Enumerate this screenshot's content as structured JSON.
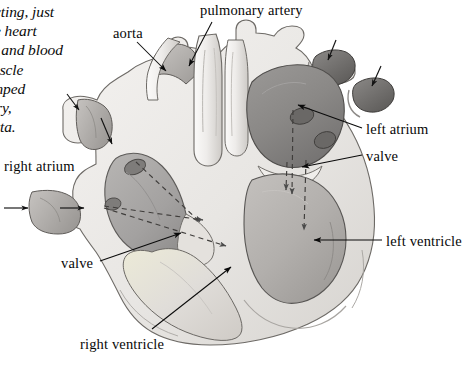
{
  "figure": {
    "type": "anatomical-diagram",
    "background_color": "#ffffff",
    "ink_color": "#080808"
  },
  "caption": {
    "note": "italic serif body text clipped by the left edge of the screenshot",
    "lines": [
      "cting, just",
      "e heart",
      "ns and blood",
      "uscle",
      "mped",
      "ry,",
      "rta."
    ]
  },
  "labels": [
    {
      "id": "pulmonary-artery",
      "text": "pulmonary artery",
      "x": 200,
      "y": 4,
      "anchor": "start"
    },
    {
      "id": "aorta",
      "text": "aorta",
      "x": 113,
      "y": 26,
      "anchor": "start"
    },
    {
      "id": "right-atrium",
      "text": "right atrium",
      "x": 4,
      "y": 159,
      "anchor": "start"
    },
    {
      "id": "left-atrium",
      "text": "left atrium",
      "x": 365,
      "y": 122,
      "anchor": "start"
    },
    {
      "id": "valve-right",
      "text": "valve",
      "x": 365,
      "y": 149,
      "anchor": "start"
    },
    {
      "id": "left-ventricle",
      "text": "left ventricle",
      "x": 385,
      "y": 234,
      "anchor": "start"
    },
    {
      "id": "valve-left",
      "text": "valve",
      "x": 61,
      "y": 256,
      "anchor": "start"
    },
    {
      "id": "right-ventricle",
      "text": "right ventricle",
      "x": 80,
      "y": 337,
      "anchor": "start"
    }
  ],
  "leader_lines": [
    {
      "id": "leader-pulmonary-artery",
      "from": [
        212,
        22
      ],
      "to": [
        188,
        68
      ],
      "arrow": true
    },
    {
      "id": "leader-aorta",
      "from": [
        137,
        42
      ],
      "to": [
        167,
        72
      ],
      "arrow": true
    },
    {
      "id": "leader-left-atrium",
      "from": [
        362,
        128
      ],
      "to": [
        296,
        104
      ],
      "arrow": true
    },
    {
      "id": "leader-valve-right",
      "from": [
        362,
        155
      ],
      "to": [
        300,
        167
      ],
      "arrow": true
    },
    {
      "id": "leader-left-ventricle",
      "from": [
        382,
        240
      ],
      "to": [
        312,
        240
      ],
      "arrow": true
    },
    {
      "id": "leader-valve-left",
      "from": [
        100,
        261
      ],
      "to": [
        182,
        234
      ],
      "arrow": true
    },
    {
      "id": "leader-right-ventricle",
      "from": [
        152,
        329
      ],
      "to": [
        232,
        268
      ],
      "arrow": true
    }
  ],
  "flow_arrows": [
    {
      "id": "flow-superior-vena-cava-in",
      "style": "solid",
      "from": [
        69,
        98
      ],
      "to": [
        80,
        112
      ]
    },
    {
      "id": "flow-superior-vena-cava-down",
      "style": "solid",
      "from": [
        103,
        120
      ],
      "to": [
        112,
        146
      ]
    },
    {
      "id": "flow-inferior-vena-cava-in",
      "style": "solid",
      "from": [
        6,
        208
      ],
      "to": [
        30,
        208
      ]
    },
    {
      "id": "flow-inferior-vena-cava-right",
      "style": "solid",
      "from": [
        62,
        208
      ],
      "to": [
        86,
        208
      ]
    },
    {
      "id": "flow-pulmonary-vein-1",
      "style": "solid",
      "from": [
        333,
        44
      ],
      "to": [
        326,
        62
      ]
    },
    {
      "id": "flow-pulmonary-vein-2",
      "style": "solid",
      "from": [
        378,
        70
      ],
      "to": [
        370,
        88
      ]
    },
    {
      "id": "flow-right-atrium-1",
      "style": "dashed",
      "from": [
        136,
        162
      ],
      "to": [
        200,
        222
      ]
    },
    {
      "id": "flow-right-atrium-2",
      "style": "dashed",
      "from": [
        104,
        206
      ],
      "to": [
        203,
        220
      ]
    },
    {
      "id": "flow-right-atrium-3",
      "style": "dashed",
      "from": [
        104,
        208
      ],
      "to": [
        228,
        248
      ]
    },
    {
      "id": "flow-left-atrium-down",
      "style": "dashed",
      "from": [
        293,
        110
      ],
      "to": [
        292,
        196
      ]
    },
    {
      "id": "flow-left-ventricle-short",
      "style": "dashed",
      "from": [
        287,
        162
      ],
      "to": [
        286,
        192
      ]
    },
    {
      "id": "flow-left-ventricle-long",
      "style": "dashed",
      "from": [
        306,
        160
      ],
      "to": [
        304,
        232
      ]
    }
  ],
  "structures": [
    {
      "id": "myocardium",
      "name": "heart muscle wall",
      "fill": "#e9e7e4"
    },
    {
      "id": "right-atrium-cavity",
      "name": "right atrium chamber",
      "fill": "#a9a7a6"
    },
    {
      "id": "left-atrium-cavity",
      "name": "left atrium chamber",
      "fill": "#8a8886"
    },
    {
      "id": "right-ventricle-cavity",
      "name": "right ventricle chamber",
      "fill": "#dedbd7"
    },
    {
      "id": "left-ventricle-cavity",
      "name": "left ventricle chamber",
      "fill": "#b4b1ae"
    },
    {
      "id": "aorta-vessel",
      "name": "aorta",
      "fill": "#b9b6b3"
    },
    {
      "id": "pulmonary-trunk",
      "name": "pulmonary artery trunk",
      "fill": "#f2f0ee"
    },
    {
      "id": "vena-cava",
      "name": "vena cava openings",
      "fill": "#b3b0ad"
    },
    {
      "id": "pulmonary-veins",
      "name": "pulmonary vein openings",
      "fill": "#6f6d6b"
    }
  ]
}
